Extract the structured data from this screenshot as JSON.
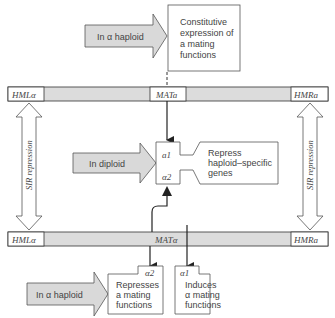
{
  "colors": {
    "line": "#333333",
    "arrow_fill": "#d9d9d9",
    "bar_fill": "#dcdcdc",
    "box_fill": "#ffffff",
    "text": "#444444"
  },
  "top_section": {
    "arrow_label": "In α haploid",
    "box_lines": [
      "Constitutive",
      "expression of",
      "a mating",
      "functions"
    ]
  },
  "chromosome_a": {
    "left_locus": "HMLα",
    "center_locus": "MATa",
    "right_locus": "HMRa"
  },
  "chromosome_alpha": {
    "left_locus": "HMLα",
    "center_locus": "MATα",
    "right_locus": "HMRa"
  },
  "sir_repression": {
    "left_label": "SIR repression",
    "right_label": "SIR repression"
  },
  "middle_section": {
    "arrow_label": "In diploid",
    "complex": {
      "top": "a1",
      "bottom": "α2"
    },
    "result_lines": [
      "Repress",
      "haploid–specific",
      "genes"
    ]
  },
  "bottom_section": {
    "arrow_label": "In α haploid",
    "alpha2_box": {
      "tag": "α2",
      "lines": [
        "Represses",
        "a mating",
        "functions"
      ]
    },
    "alpha1_box": {
      "tag": "α1",
      "lines": [
        "Induces",
        "α mating",
        "functions"
      ]
    }
  }
}
